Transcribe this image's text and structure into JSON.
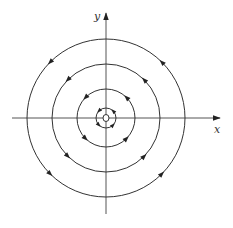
{
  "diagram": {
    "type": "phase-portrait",
    "axes": {
      "x_label": "x",
      "y_label": "y"
    },
    "center": {
      "x": 106,
      "y": 118,
      "marker": "open-circle"
    },
    "orbits": [
      {
        "radius": 79,
        "direction": "counter-clockwise"
      },
      {
        "radius": 54,
        "direction": "counter-clockwise"
      },
      {
        "radius": 29,
        "direction": "counter-clockwise"
      },
      {
        "radius": 10,
        "direction": "counter-clockwise"
      }
    ],
    "colors": {
      "stroke": "#333333",
      "axis": "#555555",
      "background": "#ffffff"
    }
  }
}
